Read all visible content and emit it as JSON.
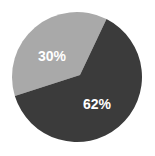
{
  "chart_data": {
    "type": "pie",
    "title": "",
    "slices": [
      {
        "label": "30%",
        "value": 30,
        "color": "#a9a9a9",
        "start_deg": 253,
        "end_deg": 387,
        "label_pos": [
          52,
          57
        ]
      },
      {
        "label": "62%",
        "value": 62,
        "color": "#3b3b3b",
        "start_deg": 27,
        "end_deg": 253,
        "label_pos": [
          97,
          105
        ]
      }
    ],
    "categories": [
      "30%",
      "62%"
    ],
    "values": [
      30,
      62
    ],
    "legend": null,
    "center": [
      77,
      77
    ],
    "radius": 65,
    "vertex": [
      80,
      75
    ]
  }
}
